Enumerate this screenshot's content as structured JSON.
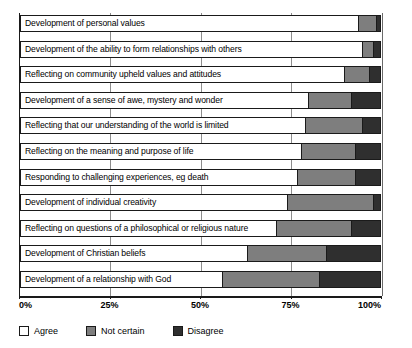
{
  "chart_data": {
    "type": "bar",
    "orientation": "horizontal",
    "stacked": true,
    "title": "",
    "subtitle": "",
    "xlabel": "",
    "ylabel": "",
    "xlim": [
      0,
      100
    ],
    "grid": true,
    "legend_position": "bottom-left",
    "xticks": [
      "0%",
      "25%",
      "50%",
      "75%",
      "100%"
    ],
    "xtick_values": [
      0,
      25,
      50,
      75,
      100
    ],
    "categories": [
      "Development of personal values",
      "Development of the ability to form relationships with others",
      "Reflecting on community upheld values and attitudes",
      "Development of a sense of awe, mystery and wonder",
      "Reflecting that our understanding of the world is limited",
      "Reflecting on the meaning and purpose of life",
      "Responding to challenging experiences, eg death",
      "Development of individual creativity",
      "Reflecting on questions of a philosophical or religious nature",
      "Development of Christian beliefs",
      "Development of a relationship with God"
    ],
    "series": [
      {
        "name": "Agree",
        "color": "#ffffff",
        "values": [
          94,
          95,
          90,
          80,
          79,
          78,
          77,
          74,
          71,
          63,
          56
        ]
      },
      {
        "name": "Not certain",
        "color": "#7e7e7e",
        "values": [
          5,
          3,
          7,
          12,
          16,
          15,
          16,
          24,
          21,
          22,
          27
        ]
      },
      {
        "name": "Disagree",
        "color": "#2f2f2f",
        "values": [
          1,
          2,
          3,
          8,
          5,
          7,
          7,
          2,
          8,
          15,
          17
        ]
      }
    ]
  },
  "legend": {
    "items": [
      {
        "label": "Agree",
        "color": "#ffffff"
      },
      {
        "label": "Not certain",
        "color": "#7e7e7e"
      },
      {
        "label": "Disagree",
        "color": "#2f2f2f"
      }
    ]
  },
  "axis": {
    "tick_labels": [
      "0%",
      "25%",
      "50%",
      "75%",
      "100%"
    ]
  }
}
